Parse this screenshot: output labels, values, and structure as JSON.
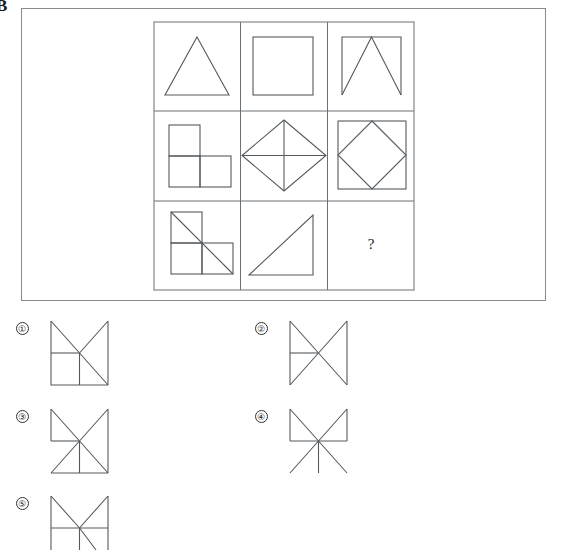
{
  "page": {
    "corner_mark": "B",
    "background_color": "#ffffff",
    "line_color": "#555a5e",
    "frame_color": "#8a8a8a"
  },
  "stem": {
    "frame": {
      "x": 21,
      "y": 8,
      "width": 525,
      "height": 293
    },
    "matrix": {
      "x": 153,
      "y": 21,
      "width": 260,
      "height": 268,
      "rows": 3,
      "columns": 3,
      "cells": [
        {
          "index": 1,
          "row": 1,
          "col": 1,
          "figure": "triangle",
          "description": "isosceles triangle"
        },
        {
          "index": 2,
          "row": 1,
          "col": 2,
          "figure": "square",
          "description": "square outline"
        },
        {
          "index": 3,
          "row": 1,
          "col": 3,
          "figure": "square-open-bottom-with-inverted-v",
          "description": "square without bottom edge plus inverted V to bottom corners"
        },
        {
          "index": 4,
          "row": 2,
          "col": 1,
          "figure": "l-tromino",
          "description": "L shaped tromino of three squares"
        },
        {
          "index": 5,
          "row": 2,
          "col": 2,
          "figure": "diamond-with-cross",
          "description": "diamond with horizontal and vertical diagonals"
        },
        {
          "index": 6,
          "row": 2,
          "col": 3,
          "figure": "square-with-inscribed-diamond",
          "description": "square containing an inscribed diamond"
        },
        {
          "index": 7,
          "row": 3,
          "col": 1,
          "figure": "l-tromino-with-diagonal",
          "description": "L tromino with diagonal from top left to bottom right"
        },
        {
          "index": 8,
          "row": 3,
          "col": 2,
          "figure": "right-triangle",
          "description": "right triangle with right angle at bottom right"
        },
        {
          "index": 9,
          "row": 3,
          "col": 3,
          "figure": "question",
          "description": "missing element",
          "label": "?"
        }
      ]
    }
  },
  "options": [
    {
      "id": "1",
      "label": "①",
      "figure": "square-with-v-and-lower-left-square",
      "description": "square with V from top corners to centre, centre to bottom right diagonal, lower left small square"
    },
    {
      "id": "2",
      "label": "②",
      "figure": "bowtie-with-left-horizontal",
      "description": "two vertical sides with full X and a short horizontal on the left half"
    },
    {
      "id": "3",
      "label": "③",
      "figure": "x-with-left-horizontal-and-lower-vertical",
      "description": "square outline with full X, horizontal on left half and vertical from centre to bottom"
    },
    {
      "id": "4",
      "label": "④",
      "figure": "x-with-full-horizontal-and-lower-vertical",
      "description": "X with full horizontal through centre, vertical from centre downwards, verticals only on upper half"
    },
    {
      "id": "5",
      "label": "⑤",
      "figure": "square-with-v-and-horizontal",
      "description": "square with V from top corners to centre and horizontal through centre, partially cropped"
    }
  ]
}
